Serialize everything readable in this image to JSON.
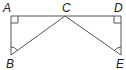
{
  "diagram": {
    "labels": {
      "A": "A",
      "B": "B",
      "C": "C",
      "D": "D",
      "E": "E"
    },
    "points": {
      "A": [
        11,
        16
      ],
      "B": [
        11,
        55
      ],
      "C": [
        65,
        16
      ],
      "D": [
        121,
        16
      ],
      "E": [
        121,
        55
      ]
    },
    "segments": [
      "AD",
      "AB",
      "DE",
      "BC",
      "CE"
    ],
    "right_angles": [
      "A",
      "D"
    ],
    "angle_marks": [
      "B",
      "E"
    ],
    "line_color": "#555555"
  }
}
